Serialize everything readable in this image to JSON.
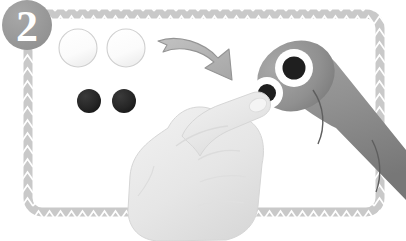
{
  "illustration": {
    "title": "Step 2 instruction illustration",
    "background_color": "#ffffff",
    "step_badge": {
      "label": "2",
      "fill_color": "#9a9a9a",
      "text_color": "#ffffff",
      "center_x": 27,
      "center_y": 25,
      "radius": 25
    },
    "frame": {
      "name": "zigzag-border-frame",
      "stroke_color": "#bdbdbd",
      "pattern": "zigzag",
      "x": 28,
      "y": 14,
      "width": 352,
      "height": 198,
      "corner_radius": 14
    },
    "white_tokens": [
      {
        "label": "white-token-1",
        "cx": 78,
        "cy": 48,
        "r": 19,
        "fill": "#fdfdfd",
        "stroke": "#cfcfcf"
      },
      {
        "label": "white-token-2",
        "cx": 126,
        "cy": 48,
        "r": 19,
        "fill": "#fdfdfd",
        "stroke": "#cfcfcf"
      }
    ],
    "dark_tokens": [
      {
        "label": "dark-token-1",
        "cx": 89,
        "cy": 101,
        "r": 12,
        "fill": "#262626"
      },
      {
        "label": "dark-token-2",
        "cx": 124,
        "cy": 101,
        "r": 12,
        "fill": "#262626"
      }
    ],
    "arrow": {
      "name": "curved-arrow",
      "fill_color": "#b4b4b4",
      "stroke_color": "#8f8f8f",
      "direction": "down-right"
    },
    "device": {
      "name": "cylindrical-device",
      "body_color": "#8f8f8f",
      "body_shadow_color": "#7d7d7d",
      "segment_line_color": "#5e5e5e",
      "buttons": [
        {
          "label": "device-button-upper",
          "cx": 294,
          "cy": 68,
          "ring_r": 19,
          "core_r": 11,
          "ring_fill": "#ffffff",
          "core_fill": "#1f1f1f"
        },
        {
          "label": "device-button-lower",
          "cx": 267,
          "cy": 93,
          "ring_r": 16,
          "core_r": 9,
          "ring_fill": "#ffffff",
          "core_fill": "#1f1f1f"
        }
      ]
    },
    "hand": {
      "name": "pointing-hand",
      "fill_color": "#e8e8e8",
      "stroke_color": "#d2d2d2",
      "shade_color": "#dcdcdc",
      "nail_color": "#f2f2f2",
      "gesture": "index-finger-press"
    }
  }
}
